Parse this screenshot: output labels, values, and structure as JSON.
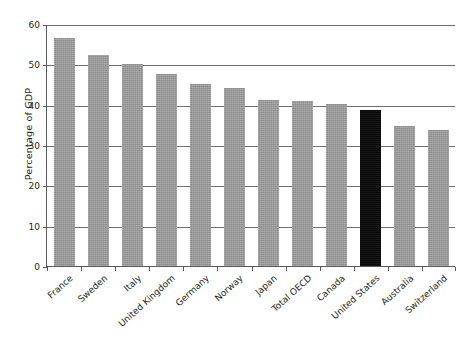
{
  "chart_data": {
    "type": "bar",
    "title": "",
    "subtitle": "",
    "xlabel": "",
    "ylabel": "Percentage of GDP",
    "ylim": [
      0,
      60
    ],
    "yticks": [
      0,
      10,
      20,
      30,
      40,
      50,
      60
    ],
    "ytick_labels": [
      "0",
      "10",
      "20",
      "30",
      "40",
      "50",
      "60"
    ],
    "grid": "horizontal",
    "legend": "none",
    "categories": [
      "France",
      "Sweden",
      "Italy",
      "United Kingdom",
      "Germany",
      "Norway",
      "Japan",
      "Total OECD",
      "Canada",
      "United States",
      "Australia",
      "Switzerland"
    ],
    "values": [
      56.5,
      52.2,
      50.0,
      47.6,
      45.1,
      44.1,
      41.2,
      41.0,
      40.1,
      38.6,
      34.7,
      33.8
    ],
    "bar_colors": [
      "#9a9a9a",
      "#9a9a9a",
      "#9a9a9a",
      "#9a9a9a",
      "#9a9a9a",
      "#9a9a9a",
      "#9a9a9a",
      "#9a9a9a",
      "#9a9a9a",
      "#0a0a0a",
      "#9a9a9a",
      "#9a9a9a"
    ],
    "highlight_category": "United States",
    "highlight_color": "#0a0a0a",
    "series_color": "#9a9a9a",
    "axis_color": "#58595b",
    "text_color": "#231f20"
  }
}
